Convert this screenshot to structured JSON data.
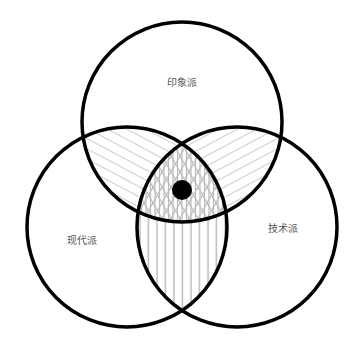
{
  "diagram": {
    "type": "venn-3",
    "sets": [
      {
        "id": "top",
        "label": "印象派",
        "cx": 182,
        "cy": 122,
        "r": 100,
        "label_x": 182,
        "label_y": 86
      },
      {
        "id": "left",
        "label": "现代派",
        "cx": 127,
        "cy": 227,
        "r": 100,
        "label_x": 82,
        "label_y": 244
      },
      {
        "id": "right",
        "label": "技术派",
        "cx": 237,
        "cy": 227,
        "r": 100,
        "label_x": 283,
        "label_y": 232
      }
    ],
    "center_marker": {
      "cx": 182,
      "cy": 190,
      "r": 10,
      "color": "#000000"
    },
    "colors": {
      "outline": "#000000",
      "hatch": "#bbbbbb",
      "label": "#555555",
      "background": "#ffffff"
    },
    "regions": [
      {
        "name": "top-left-overlap",
        "pattern": "diagonal-lines-descending"
      },
      {
        "name": "top-right-overlap",
        "pattern": "diagonal-lines-ascending"
      },
      {
        "name": "left-right-overlap",
        "pattern": "vertical-lines"
      },
      {
        "name": "triple-overlap",
        "pattern": "triangular-lattice"
      }
    ]
  }
}
